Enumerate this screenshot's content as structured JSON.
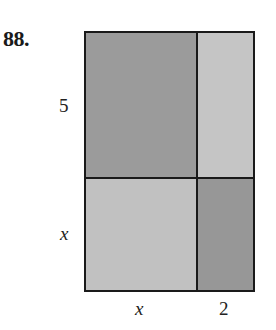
{
  "problem": {
    "number": "88."
  },
  "diagram": {
    "labels": {
      "left_top": "5",
      "left_bottom": "x",
      "bottom_left": "x",
      "bottom_right": "2"
    },
    "regions": [
      {
        "name": "top-left",
        "dims": "x by 5",
        "color": "#9a9a9a"
      },
      {
        "name": "top-right",
        "dims": "2 by 5",
        "color": "#c4c4c4"
      },
      {
        "name": "bottom-left",
        "dims": "x by x",
        "color": "#c0c0c0"
      },
      {
        "name": "bottom-right",
        "dims": "2 by x",
        "color": "#969696"
      }
    ],
    "border_color": "#1a1a1a"
  }
}
